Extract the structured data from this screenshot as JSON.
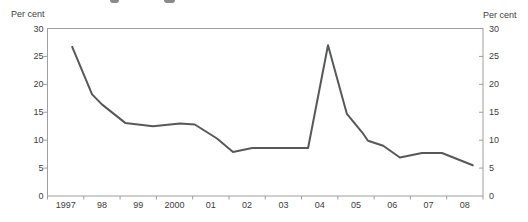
{
  "page": {
    "background_color": "#ffffff",
    "text_color": "#3c3c3c"
  },
  "header": {
    "left_axis_title": "Per cent",
    "right_axis_title": "Per cent"
  },
  "chart_data": {
    "type": "line",
    "title": "",
    "ylabel_left": "Per cent",
    "ylabel_right": "Per cent",
    "ylim": [
      0,
      30
    ],
    "yticks": [
      0,
      5,
      10,
      15,
      20,
      25,
      30
    ],
    "x_range": [
      1997,
      2009
    ],
    "x_labels": [
      "1997",
      "98",
      "99",
      "2000",
      "01",
      "02",
      "03",
      "04",
      "05",
      "06",
      "07",
      "08"
    ],
    "grid": "closed plot box, no interior gridlines",
    "legend": "none",
    "line_color": "#57585a",
    "axis_color": "#9e9e9e",
    "series": [
      {
        "name": "per-cent-series",
        "points": [
          [
            1997.68,
            26.7
          ],
          [
            1998.23,
            18.2
          ],
          [
            1998.5,
            16.4
          ],
          [
            1999.14,
            13.1
          ],
          [
            1999.91,
            12.5
          ],
          [
            2000.65,
            13.0
          ],
          [
            2001.06,
            12.8
          ],
          [
            2001.67,
            10.3
          ],
          [
            2002.11,
            7.9
          ],
          [
            2002.64,
            8.6
          ],
          [
            2004.18,
            8.6
          ],
          [
            2004.73,
            27.0
          ],
          [
            2005.25,
            14.7
          ],
          [
            2005.67,
            11.4
          ],
          [
            2005.83,
            9.9
          ],
          [
            2006.25,
            9.0
          ],
          [
            2006.71,
            6.9
          ],
          [
            2007.32,
            7.7
          ],
          [
            2007.87,
            7.7
          ],
          [
            2008.72,
            5.5
          ]
        ]
      }
    ]
  }
}
